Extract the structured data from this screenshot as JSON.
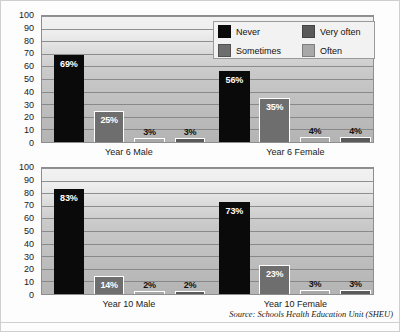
{
  "chart_data": [
    {
      "type": "bar",
      "title": "",
      "xlabel": "",
      "ylabel": "",
      "ylim": [
        0,
        100
      ],
      "yticks": [
        0,
        10,
        20,
        30,
        40,
        50,
        60,
        70,
        80,
        90,
        100
      ],
      "grid": true,
      "legend_position": "top-right",
      "categories": [
        "Year 6 Male",
        "Year 6 Female"
      ],
      "series": [
        {
          "name": "Never",
          "color": "#0a0a0a",
          "values": [
            69,
            56
          ],
          "labels": [
            "69%",
            "56%"
          ]
        },
        {
          "name": "Sometimes",
          "color": "#6e6e6e",
          "values": [
            25,
            35
          ],
          "labels": [
            "25%",
            "35%"
          ]
        },
        {
          "name": "Very often",
          "color": "#a8a8a8",
          "values": [
            3,
            4
          ],
          "labels": [
            "3%",
            "4%"
          ]
        },
        {
          "name": "Often",
          "color": "#5a5a5a",
          "values": [
            3,
            4
          ],
          "labels": [
            "3%",
            "4%"
          ]
        }
      ]
    },
    {
      "type": "bar",
      "title": "",
      "xlabel": "",
      "ylabel": "",
      "ylim": [
        0,
        100
      ],
      "yticks": [
        0,
        10,
        20,
        30,
        40,
        50,
        60,
        70,
        80,
        90,
        100
      ],
      "grid": true,
      "legend_position": "none",
      "categories": [
        "Year 10 Male",
        "Year 10 Female"
      ],
      "series": [
        {
          "name": "Never",
          "color": "#0a0a0a",
          "values": [
            83,
            73
          ],
          "labels": [
            "83%",
            "73%"
          ]
        },
        {
          "name": "Sometimes",
          "color": "#6e6e6e",
          "values": [
            14,
            23
          ],
          "labels": [
            "14%",
            "23%"
          ]
        },
        {
          "name": "Very often",
          "color": "#a8a8a8",
          "values": [
            2,
            3
          ],
          "labels": [
            "2%",
            "3%"
          ]
        },
        {
          "name": "Often",
          "color": "#5a5a5a",
          "values": [
            2,
            3
          ],
          "labels": [
            "2%",
            "3%"
          ]
        }
      ]
    }
  ],
  "axis": {
    "ticks": [
      "100",
      "90",
      "80",
      "70",
      "60",
      "50",
      "40",
      "30",
      "20",
      "10",
      "0"
    ]
  },
  "legend": {
    "items": [
      {
        "label": "Never",
        "swatch": "never"
      },
      {
        "label": "Very often",
        "swatch": "veryoften"
      },
      {
        "label": "Sometimes",
        "swatch": "sometimes"
      },
      {
        "label": "Often",
        "swatch": "often"
      }
    ]
  },
  "footer": {
    "source": "Source: Schools Health Education Unit (SHEU)"
  }
}
